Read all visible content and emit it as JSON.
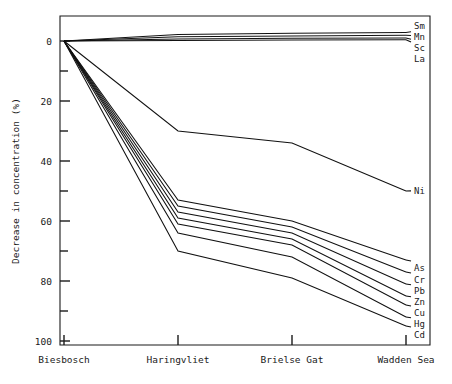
{
  "chart_data": {
    "type": "line",
    "title": "",
    "xlabel": "",
    "ylabel": "Decrease in concentration (%)",
    "categories": [
      "Biesbosch",
      "Haringvliet",
      "Brielse Gat",
      "Wadden Sea"
    ],
    "ylim": [
      -5,
      105
    ],
    "y_axis_inverted": true,
    "y_ticks_major": [
      0,
      20,
      40,
      60,
      80,
      100
    ],
    "y_ticks_minor": [
      10,
      30,
      50,
      70,
      90
    ],
    "grid": false,
    "legend_position": "right-inline-labels",
    "series": [
      {
        "name": "Sm",
        "values": [
          0,
          -2.2,
          -2.6,
          -2.8
        ]
      },
      {
        "name": "Mn",
        "values": [
          0,
          -1.4,
          -1.7,
          -1.9
        ]
      },
      {
        "name": "Sc",
        "values": [
          0,
          -0.7,
          -0.9,
          -1.0
        ]
      },
      {
        "name": "La",
        "values": [
          0,
          -0.2,
          -0.3,
          -0.4
        ]
      },
      {
        "name": "Ni",
        "values": [
          0,
          30,
          34,
          50
        ]
      },
      {
        "name": "As",
        "values": [
          0,
          53,
          60,
          73
        ]
      },
      {
        "name": "Cr",
        "values": [
          0,
          55,
          62,
          77
        ]
      },
      {
        "name": "Pb",
        "values": [
          0,
          57,
          64,
          81
        ]
      },
      {
        "name": "Zn",
        "values": [
          0,
          59,
          66,
          85
        ]
      },
      {
        "name": "Cu",
        "values": [
          0,
          61,
          68,
          88
        ]
      },
      {
        "name": "Hg",
        "values": [
          0,
          64,
          72,
          92
        ]
      },
      {
        "name": "Cd",
        "values": [
          0,
          70,
          79,
          95
        ]
      }
    ]
  },
  "axis": {
    "y_label": "Decrease in concentration (%)",
    "y_tick_0": "0",
    "y_tick_20": "20",
    "y_tick_40": "40",
    "y_tick_60": "60",
    "y_tick_80": "80",
    "y_tick_100": "100",
    "x_tick_0": "Biesbosch",
    "x_tick_1": "Haringvliet",
    "x_tick_2": "Brielse Gat",
    "x_tick_3": "Wadden Sea"
  },
  "labels": {
    "sm": "Sm",
    "mn": "Mn",
    "sc": "Sc",
    "la": "La",
    "ni": "Ni",
    "as": "As",
    "cr": "Cr",
    "pb": "Pb",
    "zn": "Zn",
    "cu": "Cu",
    "hg": "Hg",
    "cd": "Cd"
  },
  "colors": {
    "line": "#111111",
    "axis": "#1a1a1a",
    "background": "#ffffff"
  }
}
